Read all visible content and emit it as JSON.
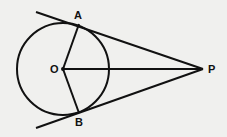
{
  "diagram": {
    "type": "geometry",
    "points": {
      "O": {
        "label": "O",
        "x": 63,
        "y": 69
      },
      "A": {
        "label": "A",
        "x": 79,
        "y": 24
      },
      "B": {
        "label": "B",
        "x": 79,
        "y": 113
      },
      "P": {
        "label": "P",
        "x": 203,
        "y": 69
      }
    },
    "circle": {
      "center": "O",
      "radius": 46
    },
    "segments": [
      "OA",
      "OB",
      "OP",
      "PA",
      "PB"
    ],
    "colors": {
      "stroke": "#111111",
      "background": "#f0f0ee"
    }
  }
}
